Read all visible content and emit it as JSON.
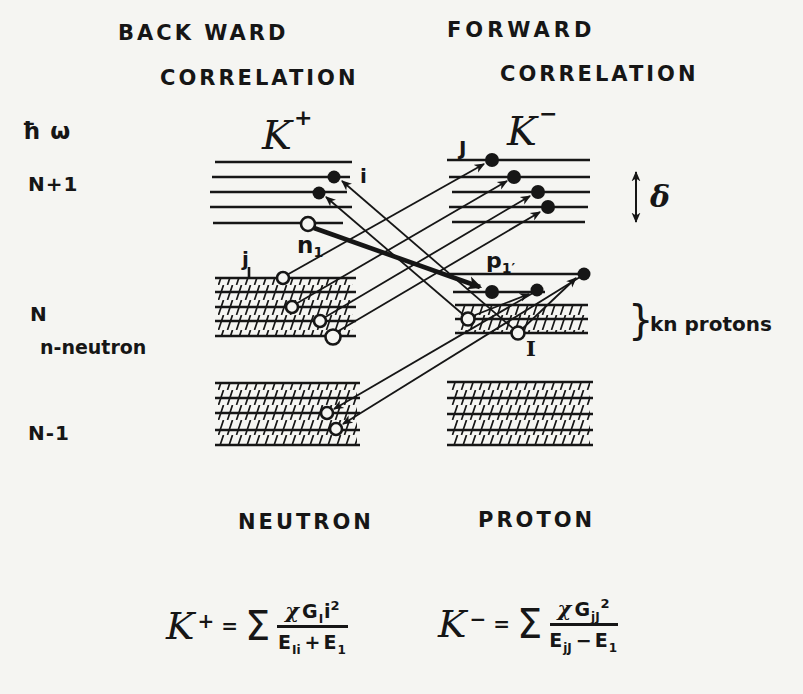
{
  "colors": {
    "background": "#f5f5f2",
    "ink": "#161616"
  },
  "titles": {
    "backward_1": "BACK WARD",
    "backward_2": "CORRELATION",
    "forward_1": "FORWARD",
    "forward_2": "CORRELATION"
  },
  "side_labels": {
    "hbar_omega": "ħ ω",
    "n_plus_one": "N+1",
    "n_mid": "N",
    "n_neutron": "n-neutron",
    "n_minus_one": "N-1"
  },
  "state_labels": {
    "k_plus": "K",
    "k_plus_sup": "+",
    "k_minus": "K",
    "k_minus_sup": "−",
    "particle_i": "i",
    "particle_J": "J",
    "hole_j": "j",
    "n1": "n",
    "n1_sub": "1",
    "p1": "p",
    "p1_sub": "1′",
    "hole_I": "I",
    "delta": "δ",
    "brace": "}",
    "kn_protons": "kn protons"
  },
  "bottom_labels": {
    "neutron": "NEUTRON",
    "proton": "PROTON"
  },
  "formulas": {
    "left": {
      "k": "K",
      "sup": "+",
      "eq": "=",
      "sigma": "Σ",
      "num_chi": "χ",
      "num_g": "G",
      "num_g_sub": "I",
      "num_i": "i",
      "num_exp": "2",
      "den_e1": "E",
      "den_e1_sub": "Ii",
      "den_op": "+",
      "den_e2": "E",
      "den_e2_sub": "1"
    },
    "right": {
      "k": "K",
      "sup": "−",
      "eq": "=",
      "sigma": "Σ",
      "num_chi": "χ",
      "num_g": "G",
      "num_g_sub": "jJ",
      "num_exp": "2",
      "den_e1": "E",
      "den_e1_sub": "jJ",
      "den_op": "−",
      "den_e2": "E",
      "den_e2_sub": "1"
    }
  }
}
